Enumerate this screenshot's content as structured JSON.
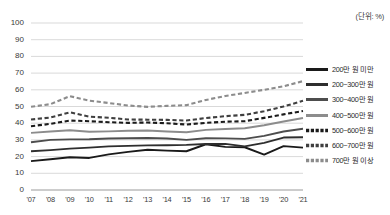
{
  "unit_note": "(단위: %)",
  "chart_data": {
    "type": "line",
    "title": "",
    "subtitle": "",
    "xlabel": "",
    "ylabel": "",
    "unit": "%",
    "grid": true,
    "legend_position": "right",
    "ylim": [
      0,
      100
    ],
    "ytick_step": 10,
    "yticks": [
      "0",
      "10",
      "20",
      "30",
      "40",
      "50",
      "60",
      "70",
      "80",
      "90",
      "100"
    ],
    "categories": [
      "'07",
      "'08",
      "'09",
      "'10",
      "'11",
      "'12",
      "'13",
      "'14",
      "'15",
      "'16",
      "'17",
      "'18",
      "'19",
      "'20",
      "'21"
    ],
    "series": [
      {
        "name": "200만 원 미만",
        "style": "solid",
        "color": "#1a1a1a",
        "width": 1.9,
        "values": [
          17.3,
          18.4,
          19.6,
          19.2,
          21.3,
          22.8,
          24.1,
          23.6,
          23.2,
          27.4,
          25.8,
          25.6,
          21.2,
          26.3,
          25.4
        ]
      },
      {
        "name": "200~300만 원",
        "style": "solid",
        "color": "#2e2e2e",
        "width": 1.9,
        "values": [
          23.2,
          23.9,
          24.8,
          25.4,
          26.1,
          26.4,
          26.7,
          26.8,
          27.0,
          27.5,
          27.6,
          26.1,
          28.2,
          31.4,
          31.6
        ]
      },
      {
        "name": "300~400만 원",
        "style": "solid",
        "color": "#4d4d4d",
        "width": 1.9,
        "values": [
          28.6,
          30.0,
          30.3,
          30.4,
          30.8,
          31.0,
          31.1,
          30.8,
          30.0,
          31.0,
          30.9,
          30.6,
          32.4,
          35.0,
          36.7
        ]
      },
      {
        "name": "400~500만 원",
        "style": "solid",
        "color": "#8c8c8c",
        "width": 1.9,
        "values": [
          34.2,
          35.0,
          35.8,
          34.9,
          35.1,
          35.5,
          35.6,
          35.0,
          34.6,
          36.0,
          36.5,
          37.0,
          38.8,
          41.0,
          43.1
        ]
      },
      {
        "name": "500~600만 원",
        "style": "dashed",
        "color": "#1a1a1a",
        "width": 2.1,
        "values": [
          38.2,
          39.6,
          41.6,
          41.2,
          40.6,
          40.2,
          40.4,
          40.0,
          39.2,
          40.2,
          40.9,
          41.2,
          43.2,
          45.3,
          47.3
        ]
      },
      {
        "name": "600~700만 원",
        "style": "dashed",
        "color": "#3f3f3f",
        "width": 2.1,
        "values": [
          42.2,
          43.4,
          46.5,
          43.9,
          43.3,
          42.2,
          42.1,
          42.0,
          41.6,
          43.1,
          44.2,
          45.0,
          47.2,
          50.0,
          53.4
        ]
      },
      {
        "name": "700만 원 이상",
        "style": "dashed",
        "color": "#8c8c8c",
        "width": 2.1,
        "values": [
          49.8,
          51.4,
          56.2,
          53.5,
          52.1,
          50.6,
          49.8,
          50.4,
          50.8,
          53.9,
          56.3,
          58.1,
          60.0,
          62.1,
          65.2
        ]
      }
    ]
  }
}
